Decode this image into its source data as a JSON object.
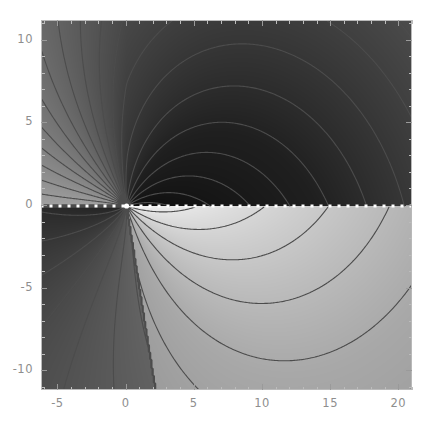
{
  "figure": {
    "title": "",
    "background_color": "#ffffff",
    "frame_color": "#b9b9b9",
    "tick_color": "#9a9a9a",
    "label_color": "#8e8e8e"
  },
  "axes": {
    "x": {
      "label": "",
      "min": -6.2,
      "max": 21.0,
      "ticks": [
        -5,
        0,
        5,
        10,
        15,
        20
      ],
      "tick_labels": [
        "-5",
        "0",
        "5",
        "10",
        "15",
        "20"
      ],
      "minor_step": 1
    },
    "y": {
      "label": "",
      "min": -11.2,
      "max": 11.2,
      "ticks": [
        10,
        5,
        0,
        -5,
        -10
      ],
      "tick_labels": [
        "10",
        "5",
        "0",
        "-5",
        "-10"
      ],
      "minor_step": 1
    }
  },
  "chart_data": {
    "type": "heatmap",
    "title": "",
    "xlabel": "",
    "ylabel": "",
    "xlim": [
      -6.2,
      21.0
    ],
    "ylim": [
      -11.2,
      11.2
    ],
    "grid": false,
    "legend": "none",
    "colormap": "grayscale",
    "colormap_stops": [
      {
        "t": 0.0,
        "color": "#0d0d0d"
      },
      {
        "t": 0.18,
        "color": "#1f1f1f"
      },
      {
        "t": 0.35,
        "color": "#4a4a4a"
      },
      {
        "t": 0.52,
        "color": "#6f6f6f"
      },
      {
        "t": 0.66,
        "color": "#8a8a8a"
      },
      {
        "t": 0.8,
        "color": "#a8a8a8"
      },
      {
        "t": 0.9,
        "color": "#cdcdcd"
      },
      {
        "t": 1.0,
        "color": "#f4f4f4"
      }
    ],
    "singularities": [
      {
        "name": "branch-point",
        "x": 0,
        "y": 0
      },
      {
        "name": "saddle-point",
        "x": 12.1,
        "y": 0.1
      }
    ],
    "branch_cut": {
      "style": "white-dotted",
      "color": "#ffffff",
      "y": 0,
      "x_start": -6.2,
      "x_end": 21.0,
      "dot_spacing": 9,
      "dot_size": 3
    },
    "contours": {
      "color": "#4c4c4c",
      "line_width": 1.1,
      "count": 26,
      "note": "Level curves emanate radially from the branch point and bend into hyperbola-like arcs in the right half plane."
    },
    "quadrant_levels": [
      {
        "region": "upper-left",
        "approx_gray": "#f0f0f0",
        "value_hint": 1.0
      },
      {
        "region": "upper-right",
        "approx_gray": "#8a8a8a",
        "value_hint": 0.64
      },
      {
        "region": "lower-right",
        "approx_gray": "#9d9d9d",
        "value_hint": 0.72
      },
      {
        "region": "lower-left",
        "approx_gray": "#171717",
        "value_hint": 0.05
      }
    ]
  }
}
